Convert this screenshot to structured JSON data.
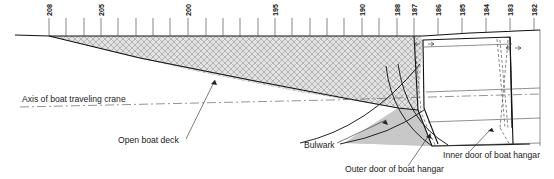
{
  "figure": {
    "type": "naval-architecture-profile-drawing",
    "title_present": false,
    "background_color": "#ffffff",
    "line_color": "#111111"
  },
  "frame_labels": [
    {
      "text": "208",
      "x": 49,
      "tick_x": 49
    },
    {
      "text": "205",
      "x": 101,
      "tick_x": 101
    },
    {
      "text": "200",
      "x": 188,
      "tick_x": 188
    },
    {
      "text": "195",
      "x": 275,
      "tick_x": 275
    },
    {
      "text": "190",
      "x": 362,
      "tick_x": 362
    },
    {
      "text": "188",
      "x": 397,
      "tick_x": 397
    },
    {
      "text": "187",
      "x": 414,
      "tick_x": 414
    },
    {
      "text": "186",
      "x": 438,
      "tick_x": 438
    },
    {
      "text": "185",
      "x": 462,
      "tick_x": 462
    },
    {
      "text": "184",
      "x": 486,
      "tick_x": 486
    },
    {
      "text": "183",
      "x": 510,
      "tick_x": 510
    },
    {
      "text": "182",
      "x": 534,
      "tick_x": 534
    }
  ],
  "unlabeled_tick_positions": [
    66,
    84,
    118,
    136,
    153,
    170,
    206,
    223,
    240,
    258,
    292,
    310,
    327,
    344,
    379
  ],
  "callouts": [
    {
      "id": "axis-of-boat-traveling-crane",
      "label": "Axis of boat traveling crane",
      "text_x": 22,
      "text_y": 102,
      "anchor": "start"
    },
    {
      "id": "open-boat-deck",
      "label": "Open boat deck",
      "text_x": 118,
      "text_y": 143,
      "anchor": "start",
      "leader": "M 186 139 L 215 80"
    },
    {
      "id": "bulwark",
      "label": "Bulwark",
      "text_x": 304,
      "text_y": 148,
      "anchor": "start",
      "leader": "M 337 143 L 386 120"
    },
    {
      "id": "outer-door-of-boat-hangar",
      "label": "Outer door of boat hangar",
      "text_x": 345,
      "text_y": 172,
      "anchor": "start",
      "leader": "M 408 166 L 430 134"
    },
    {
      "id": "inner-door-of-boat-hangar",
      "label": "Inner door of boat hangar",
      "text_x": 443,
      "text_y": 158,
      "anchor": "start",
      "leader": "M 470 151 L 492 128"
    }
  ],
  "regions": [
    {
      "id": "bulwark-hatched-region",
      "fill_pattern": "cross-hatch",
      "fill_color": "#d9d9d9"
    },
    {
      "id": "hull-solid-region",
      "fill_color": "#cccccc"
    }
  ],
  "geometry": {
    "deck_line_top_y": 36,
    "axis_line_y": 104,
    "hangar_left_x": 418,
    "hangar_right_x": 510
  }
}
